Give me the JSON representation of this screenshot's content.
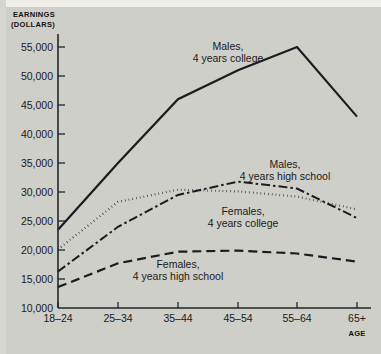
{
  "chart_data": {
    "type": "line",
    "title": "",
    "xlabel": "AGE",
    "ylabel": "EARNINGS (DOLLARS)",
    "ylabel_line1": "EARNINGS",
    "ylabel_line2": "(DOLLARS)",
    "categories": [
      "18–24",
      "25–34",
      "35–44",
      "45–54",
      "55–64",
      "65+"
    ],
    "ytick_labels": [
      "10,000",
      "15,000",
      "20,000",
      "25,000",
      "30,000",
      "35,000",
      "40,000",
      "45,000",
      "50,000",
      "55,000"
    ],
    "ytick_values": [
      10000,
      15000,
      20000,
      25000,
      30000,
      35000,
      40000,
      45000,
      50000,
      55000
    ],
    "ylim": [
      10000,
      55000
    ],
    "grid": false,
    "legend_position": "inline-annotations",
    "series": [
      {
        "name": "Males, 4 years college",
        "label_line1": "Males,",
        "label_line2": "4 years college",
        "style": "solid",
        "values": [
          23500,
          35000,
          46000,
          51000,
          55000,
          43000
        ]
      },
      {
        "name": "Males, 4 years high school",
        "label_line1": "Males,",
        "label_line2": "4 years high school",
        "style": "dash-dot",
        "values": [
          16300,
          24000,
          29500,
          31800,
          30600,
          25500
        ]
      },
      {
        "name": "Females, 4 years college",
        "label_line1": "Females,",
        "label_line2": "4 years college",
        "style": "dotted",
        "values": [
          20100,
          28300,
          30400,
          30100,
          29200,
          27000
        ]
      },
      {
        "name": "Females, 4 years high school",
        "label_line1": "Females,",
        "label_line2": "4 years high school",
        "style": "dashed",
        "values": [
          13600,
          17700,
          19700,
          19900,
          19400,
          18000
        ]
      }
    ]
  }
}
